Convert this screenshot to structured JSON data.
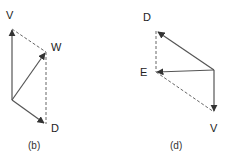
{
  "colors": {
    "solid": "#555555",
    "dashed": "#555555",
    "text": "#222222",
    "background": "#ffffff"
  },
  "panels": [
    {
      "id": "b",
      "caption": "(b)",
      "origin": [
        12,
        100
      ],
      "vectors": [
        {
          "label": "V",
          "tip": [
            12,
            29
          ],
          "style": "solid"
        },
        {
          "label": "W",
          "tip": [
            46,
            52
          ],
          "style": "solid"
        },
        {
          "label": "D",
          "tip": [
            45,
            124
          ],
          "style": "solid"
        }
      ],
      "dashed_lines": [
        {
          "from": "V",
          "to": "W"
        },
        {
          "from": "W",
          "to": "D"
        }
      ],
      "labels": {
        "V": "V",
        "W": "W",
        "D": "D"
      }
    },
    {
      "id": "d",
      "caption": "(d)",
      "origin": [
        214,
        70
      ],
      "vectors": [
        {
          "label": "D",
          "tip": [
            157,
            31
          ],
          "style": "solid"
        },
        {
          "label": "E",
          "tip": [
            156,
            72
          ],
          "style": "solid"
        },
        {
          "label": "V",
          "tip": [
            214,
            112
          ],
          "style": "solid"
        }
      ],
      "dashed_lines": [
        {
          "from": "D",
          "to": "E"
        },
        {
          "from": "E",
          "to": "V"
        }
      ],
      "labels": {
        "D": "D",
        "E": "E",
        "V": "V"
      }
    }
  ]
}
